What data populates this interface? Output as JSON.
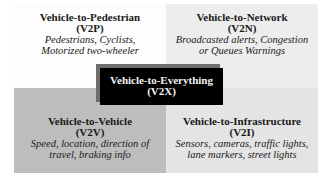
{
  "diagram": {
    "center": {
      "title": "Vehicle-to-Everything",
      "abbr": "(V2X)"
    },
    "quadrants": [
      {
        "position": "top-left",
        "title": "Vehicle-to-Pedestrian",
        "abbr": "(V2P)",
        "description_lines": [
          "Pedestrians, Cyclists,",
          "Motorized two-wheeler"
        ],
        "background": "#fdfdfd"
      },
      {
        "position": "top-right",
        "title": "Vehicle-to-Network",
        "abbr": "(V2N)",
        "description_lines": [
          "Broadcasted alerts, Congestion",
          "or Queues Warnings"
        ],
        "background": "#ededed"
      },
      {
        "position": "bottom-left",
        "title": "Vehicle-to-Vehicle",
        "abbr": "(V2V)",
        "description_lines": [
          "Speed, location, direction of",
          "travel, braking info"
        ],
        "background": "#bdbdbd"
      },
      {
        "position": "bottom-right",
        "title": "Vehicle-to-Infrastructure",
        "abbr": "(V2I)",
        "description_lines": [
          "Sensors, cameras, traffic lights,",
          "lane markers, street lights"
        ],
        "background": "#e4e4e4"
      }
    ]
  }
}
